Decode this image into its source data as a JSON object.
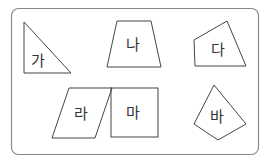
{
  "panel": {
    "border_color": "#8a8a8a"
  },
  "shapes": [
    {
      "id": "ga",
      "label": "가",
      "type": "right-triangle"
    },
    {
      "id": "na",
      "label": "나",
      "type": "trapezoid"
    },
    {
      "id": "da",
      "label": "다",
      "type": "quadrilateral"
    },
    {
      "id": "ra",
      "label": "라",
      "type": "parallelogram"
    },
    {
      "id": "ma",
      "label": "마",
      "type": "square"
    },
    {
      "id": "ba",
      "label": "바",
      "type": "quadrilateral"
    }
  ]
}
